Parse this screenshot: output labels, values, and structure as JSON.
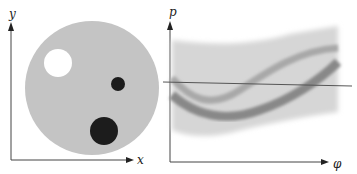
{
  "left_panel": {
    "x_axis_label": "x",
    "y_axis_label": "y",
    "disk_color": "#c4c4c4",
    "objects": [
      {
        "name": "white-hole",
        "color": "#ffffff"
      },
      {
        "name": "small-dark-spot",
        "color": "#1a1a1a"
      },
      {
        "name": "large-dark-spot",
        "color": "#1a1a1a"
      }
    ]
  },
  "right_panel": {
    "x_axis_label": "φ",
    "y_axis_label": "p",
    "band_color": "#d0d0d0",
    "curve_color": "#8a8a8a",
    "line_color": "#555555"
  }
}
